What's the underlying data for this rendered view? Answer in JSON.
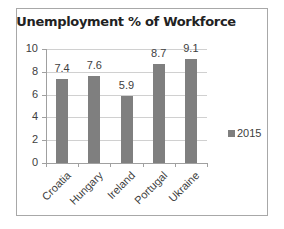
{
  "chart_data": {
    "type": "bar",
    "title": "Unemployment % of Workforce",
    "categories": [
      "Croatia",
      "Hungary",
      "Ireland",
      "Portugal",
      "Ukraine"
    ],
    "series": [
      {
        "name": "2015",
        "values": [
          7.4,
          7.6,
          5.9,
          8.7,
          9.1
        ],
        "color": "#7f7f7f"
      }
    ],
    "data_labels": [
      "7.4",
      "7.6",
      "5.9",
      "8.7",
      "9.1"
    ],
    "xlabel": "",
    "ylabel": "",
    "ylim": [
      0,
      10
    ],
    "yticks": [
      "0",
      "2",
      "4",
      "6",
      "8",
      "10"
    ],
    "grid": true,
    "legend_position": "right"
  }
}
